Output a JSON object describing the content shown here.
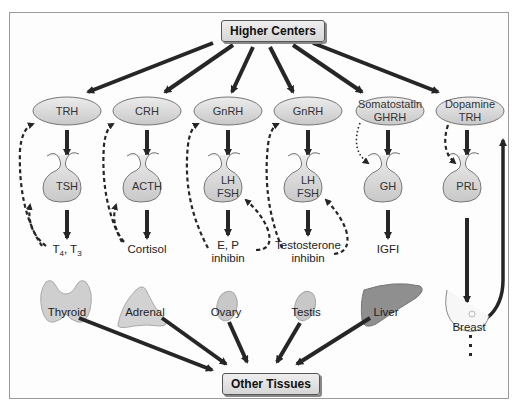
{
  "diagram": {
    "top_node": "Higher Centers",
    "bottom_node": "Other Tissues",
    "axes": [
      {
        "hypothalamic": "TRH",
        "pituitary": "TSH",
        "hormone": "T4, T3",
        "hormone_sub": [
          "T",
          "4",
          ", T",
          "3"
        ],
        "organ": "Thyroid"
      },
      {
        "hypothalamic": "CRH",
        "pituitary": "ACTH",
        "hormone": "Cortisol",
        "organ": "Adrenal"
      },
      {
        "hypothalamic": "GnRH",
        "pituitary_line1": "LH",
        "pituitary_line2": "FSH",
        "hormone_line1": "E, P",
        "hormone_line2": "inhibin",
        "organ": "Ovary"
      },
      {
        "hypothalamic": "GnRH",
        "pituitary_line1": "LH",
        "pituitary_line2": "FSH",
        "hormone_line1": "Testosterone",
        "hormone_line2": "inhibin",
        "organ": "Testis"
      },
      {
        "hypothalamic_line1": "Somatostatin",
        "hypothalamic_line2": "GHRH",
        "pituitary": "GH",
        "hormone": "IGFI",
        "organ": "Liver"
      },
      {
        "hypothalamic_line1": "Dopamine",
        "hypothalamic_line2": "TRH",
        "pituitary": "PRL",
        "hormone": "",
        "organ": "Breast"
      }
    ],
    "colors": {
      "arrow": "#262626",
      "node_fill": "#e4e4e4",
      "organ_fill": "#d0d0d0",
      "liver_fill": "#8f8f8f",
      "frame_border": "#9a9a9a"
    }
  }
}
